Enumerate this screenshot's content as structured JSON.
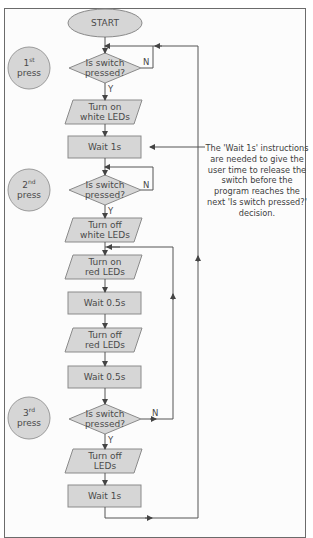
{
  "diagram": {
    "type": "flowchart",
    "colors": {
      "shape_fill": "#d6d6d6",
      "shape_stroke": "#8a8a8a",
      "line": "#555555",
      "text": "#4a4a4a",
      "frame_border": "#6b6b6b"
    },
    "nodes": {
      "start": "START",
      "decision1": "Is switch pressed?",
      "io1_line1": "Turn on",
      "io1_line2": "white LEDs",
      "wait1": "Wait 1s",
      "decision2": "Is switch pressed?",
      "io2_line1": "Turn off",
      "io2_line2": "white LEDs",
      "io3_line1": "Turn on",
      "io3_line2": "red LEDs",
      "wait2": "Wait 0.5s",
      "io4_line1": "Turn off",
      "io4_line2": "red LEDs",
      "wait3": "Wait 0.5s",
      "decision3": "Is switch pressed?",
      "io5_line1": "Turn off",
      "io5_line2": "LEDs",
      "wait4": "Wait 1s"
    },
    "decision_lines": {
      "line1": "Is switch",
      "line2": "pressed?"
    },
    "branch_labels": {
      "yes": "Y",
      "no": "N"
    },
    "press_badges": [
      {
        "num": "1",
        "suffix": "st",
        "word": "press"
      },
      {
        "num": "2",
        "suffix": "nd",
        "word": "press"
      },
      {
        "num": "3",
        "suffix": "rd",
        "word": "press"
      }
    ],
    "annotation": "The 'Wait 1s' instructions are needed to give the user time to release the switch before the program reaches the next 'Is switch pressed?' decision."
  }
}
